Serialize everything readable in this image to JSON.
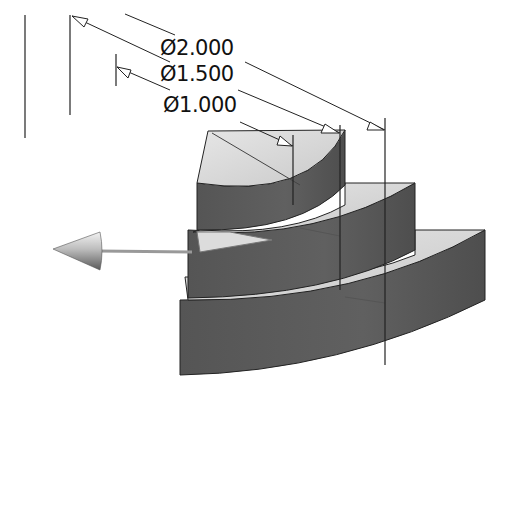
{
  "figure": {
    "type": "cad-isometric-view",
    "caption_fragment": "",
    "part": "three-step quarter-cylinder",
    "tiers": [
      {
        "name": "top-tier",
        "diameter": "Ø1.000"
      },
      {
        "name": "middle-tier",
        "diameter": "Ø1.500"
      },
      {
        "name": "bottom-tier",
        "diameter": "Ø2.000"
      }
    ],
    "dimensions": [
      {
        "label": "Ø2.000",
        "value": 2.0
      },
      {
        "label": "Ø1.500",
        "value": 1.5
      },
      {
        "label": "Ø1.000",
        "value": 1.0
      }
    ],
    "axis_arrow": {
      "direction": "left",
      "icon": "axis-arrow-icon"
    },
    "colors": {
      "face_light": "#d8d8d8",
      "face_mid": "#c4c4c4",
      "wall_dark": "#5c5c5c",
      "line": "#222222",
      "background": "#ffffff"
    }
  }
}
